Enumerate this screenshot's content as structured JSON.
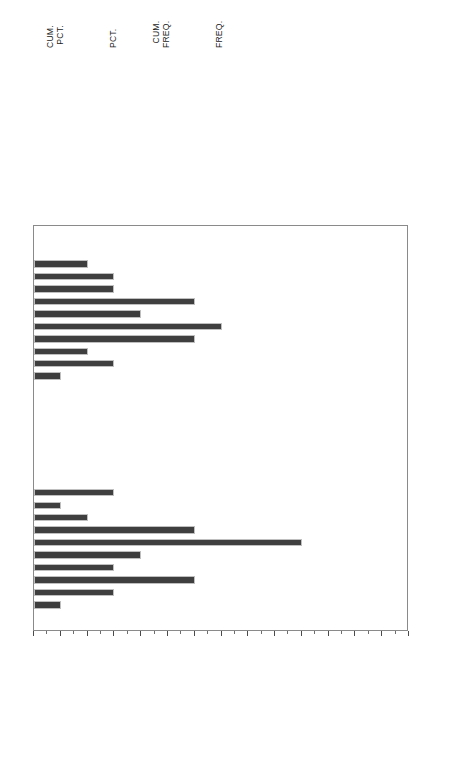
{
  "chart_data": {
    "type": "bar",
    "title": "",
    "orientation": "horizontal-rotated",
    "xlabel": "Frequency",
    "ylabel": "Fertility rate",
    "grouplabel": "Religion",
    "xlim": [
      1,
      15
    ],
    "xticks": [
      1,
      2,
      3,
      4,
      5,
      6,
      7,
      8,
      9,
      10,
      11,
      12,
      13,
      14,
      15
    ],
    "grid": false,
    "legend": "none",
    "categories": [
      1,
      2,
      3,
      4,
      5,
      6,
      7,
      8,
      9,
      10,
      11,
      12,
      13,
      14,
      15
    ],
    "groups": [
      {
        "name": "1",
        "values": [
          1,
          1,
          3,
          4,
          4,
          7,
          5,
          8,
          7,
          3,
          4,
          2,
          0,
          1,
          0
        ]
      },
      {
        "name": "2",
        "values": [
          0,
          0,
          0,
          0,
          4,
          2,
          3,
          7,
          11,
          5,
          4,
          7,
          4,
          2,
          1
        ]
      }
    ]
  },
  "table": {
    "headers": [
      {
        "id": "cum-pct",
        "line1": "CUM.",
        "line2": "PCT."
      },
      {
        "id": "pct",
        "line1": "",
        "line2": "PCT."
      },
      {
        "id": "cum-freq",
        "line1": "CUM.",
        "line2": "FREQ."
      },
      {
        "id": "freq",
        "line1": "",
        "line2": "FREQ."
      }
    ],
    "group1": {
      "freq": [
        "1",
        "1",
        "3",
        "4",
        "4",
        "7",
        "5",
        "8",
        "7",
        "3",
        "4",
        "2",
        "0",
        "1",
        "0"
      ],
      "cum_freq": [
        "1",
        "2",
        "5",
        "9",
        "13",
        "20",
        "25",
        "33",
        "40",
        "43",
        "47",
        "49",
        "49",
        "50",
        "50"
      ],
      "pct": [
        "1",
        "1",
        "3",
        "4",
        "4",
        "7",
        "5",
        "8",
        "7",
        "3",
        "4",
        "2",
        "0",
        "1",
        "0"
      ],
      "cum_pct": [
        "1",
        "2",
        "5",
        "9",
        "13",
        "20",
        "25",
        "33",
        "40",
        "43",
        "47",
        "49",
        "49",
        "50",
        "50"
      ]
    },
    "group2": {
      "freq": [
        "0",
        "0",
        "0",
        "0",
        "4",
        "2",
        "3",
        "7",
        "11",
        "5",
        "4",
        "7",
        "4",
        "2",
        "1"
      ],
      "cum_freq": [
        "50",
        "50",
        "50",
        "50",
        "54",
        "56",
        "59",
        "66",
        "77",
        "82",
        "86",
        "93",
        "97",
        "99",
        "100"
      ],
      "pct": [
        "0",
        "0",
        "0",
        "0",
        "4",
        "2",
        "3",
        "7",
        "11",
        "5",
        "4",
        "7",
        "4",
        "2",
        "1"
      ],
      "cum_pct": [
        "50",
        "50",
        "50",
        "50",
        "54",
        "56",
        "59",
        "66",
        "77",
        "82",
        "86",
        "93",
        "97",
        "99",
        "100"
      ]
    }
  },
  "axis": {
    "frequency_title": "Frequency",
    "fertility_title": "Fertility rate",
    "religion_title": "Religion",
    "freq_ticks": [
      "1",
      "2",
      "3",
      "4",
      "5",
      "6",
      "7",
      "8",
      "9",
      "10",
      "11",
      "12",
      "13",
      "14",
      "15"
    ],
    "cat_ticks": [
      "1",
      "2",
      "3",
      "4",
      "5",
      "6",
      "7",
      "8",
      "9",
      "10",
      "11",
      "12",
      "13",
      "14",
      "15"
    ],
    "religion_values": [
      "1",
      "2"
    ]
  },
  "colors": {
    "bar_fill": "#3f3f3f",
    "bar_edge": "#bfbfbf",
    "frame": "#8a8a8a",
    "text": "#1a1a1a",
    "background": "#ffffff"
  }
}
